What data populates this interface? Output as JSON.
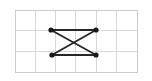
{
  "figure": {
    "title": "",
    "type": "graph-diagram",
    "canvas": {
      "width": 152,
      "height": 81,
      "background_color": "#ffffff"
    },
    "grid": {
      "name": "graph-paper-grid",
      "visible": true,
      "columns": 6,
      "rows": 3,
      "x": 15,
      "y": 10,
      "width": 122,
      "height": 62,
      "cell_width": 20.33,
      "cell_height": 20.67,
      "line_color": "#d8d8d8",
      "border_color": "#cccccc",
      "line_width": 1
    },
    "graph": {
      "vertex_count": 4,
      "edge_count": 4,
      "vertex_color": "#1a1a1a",
      "vertex_radius": 2.6,
      "edge_color": "#262626",
      "edge_width": 1.8,
      "vertices": [
        {
          "id": "v1",
          "label": "",
          "x": 51,
          "y": 30,
          "position": "top-left"
        },
        {
          "id": "v2",
          "label": "",
          "x": 96,
          "y": 30,
          "position": "top-right"
        },
        {
          "id": "v3",
          "label": "",
          "x": 52,
          "y": 55,
          "position": "bottom-left"
        },
        {
          "id": "v4",
          "label": "",
          "x": 96,
          "y": 55,
          "position": "bottom-right"
        }
      ],
      "edges": [
        {
          "id": "e1",
          "from": "v1",
          "to": "v2",
          "kind": "top-edge"
        },
        {
          "id": "e2",
          "from": "v3",
          "to": "v4",
          "kind": "bottom-edge"
        },
        {
          "id": "e3",
          "from": "v1",
          "to": "v4",
          "kind": "diagonal"
        },
        {
          "id": "e4",
          "from": "v2",
          "to": "v3",
          "kind": "diagonal"
        }
      ],
      "crossing_point": {
        "x": 73.8,
        "y": 42.4
      }
    }
  },
  "chart_data": {
    "type": "diagram",
    "title": "",
    "xlabel": "",
    "ylabel": "",
    "nodes": [
      {
        "name": "v1",
        "x": 51,
        "y": 30
      },
      {
        "name": "v2",
        "x": 96,
        "y": 30
      },
      {
        "name": "v3",
        "x": 52,
        "y": 55
      },
      {
        "name": "v4",
        "x": 96,
        "y": 55
      }
    ],
    "links": [
      [
        "v1",
        "v2"
      ],
      [
        "v3",
        "v4"
      ],
      [
        "v1",
        "v4"
      ],
      [
        "v2",
        "v3"
      ]
    ]
  }
}
